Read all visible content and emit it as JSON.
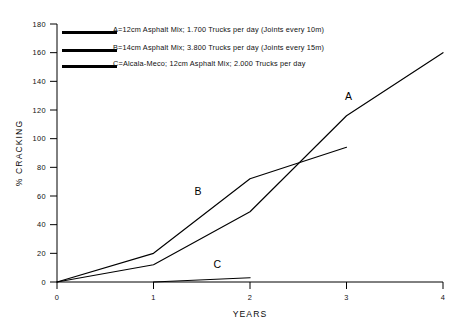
{
  "chart_data": {
    "type": "line",
    "title": "",
    "xlabel": "YEARS",
    "ylabel": "% CRACKING",
    "xlim": [
      0,
      4
    ],
    "ylim": [
      0,
      180
    ],
    "xticks": [
      "0",
      "1",
      "2",
      "3",
      "4"
    ],
    "yticks": [
      "0",
      "20",
      "40",
      "60",
      "80",
      "100",
      "120",
      "140",
      "160",
      "180"
    ],
    "grid": false,
    "legend_position": "top-left",
    "series": [
      {
        "name": "A",
        "label": "A=12cm Asphalt Mix; 1.700 Trucks per day (Joints every 10m)",
        "color": "#000000",
        "x": [
          0,
          1,
          2,
          3,
          4
        ],
        "values": [
          0,
          12,
          49,
          116,
          160
        ],
        "tag": "A",
        "tag_x": 3.02,
        "tag_y": 127
      },
      {
        "name": "B",
        "label": "B=14cm Asphalt Mix; 3.800 Trucks per day (Joints every 15m)",
        "color": "#000000",
        "x": [
          0,
          1,
          2,
          3
        ],
        "values": [
          0,
          20,
          72,
          94
        ],
        "tag": "B",
        "tag_x": 1.46,
        "tag_y": 61
      },
      {
        "name": "C",
        "label": "C=Alcala-Meco; 12cm Asphalt Mix; 2.000 Trucks per day",
        "color": "#000000",
        "x": [
          1,
          2
        ],
        "values": [
          0,
          3
        ],
        "tag": "C",
        "tag_x": 1.66,
        "tag_y": 10
      }
    ]
  },
  "legend": {
    "entries": [
      {
        "swatch": "line-swatch-a",
        "text": "A=12cm Asphalt Mix; 1.700 Trucks per day (Joints every 10m)"
      },
      {
        "swatch": "line-swatch-b",
        "text": "B=14cm Asphalt Mix; 3.800 Trucks per day (Joints every 15m)"
      },
      {
        "swatch": "line-swatch-c",
        "text": "C=Alcala-Meco; 12cm Asphalt Mix; 2.000 Trucks per day"
      }
    ]
  },
  "axes": {
    "y_title": "% CRACKING",
    "x_title": "YEARS",
    "y_tick_labels": [
      "180",
      "160",
      "140",
      "120",
      "100",
      "80",
      "60",
      "40",
      "20",
      "0"
    ],
    "x_tick_labels": [
      "0",
      "1",
      "2",
      "3",
      "4"
    ]
  }
}
